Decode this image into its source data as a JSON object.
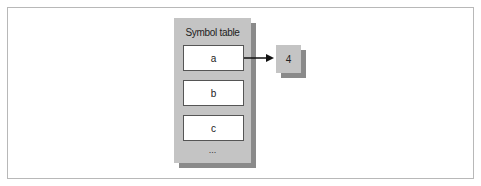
{
  "diagram": {
    "symbol_table": {
      "title": "Symbol table",
      "slots": [
        "a",
        "b",
        "c"
      ],
      "ellipsis": "..."
    },
    "value_box": {
      "label": "4"
    },
    "edges": [
      {
        "from": "a",
        "to": "4"
      }
    ],
    "colors": {
      "panel": "#c4c4c4",
      "shadow": "#8a8a8a",
      "slot_fill": "#ffffff",
      "slot_border": "#555555",
      "arrow": "#111111",
      "frame_border": "#b8b8b8"
    }
  }
}
